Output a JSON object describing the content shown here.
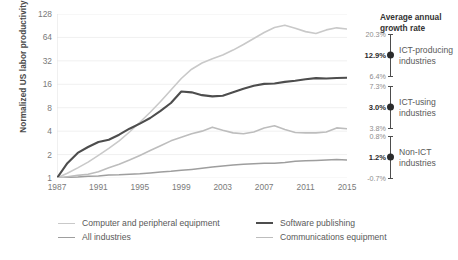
{
  "chart_data": {
    "type": "line",
    "title": "",
    "xlabel": "",
    "ylabel": "Normalized US labor productivity",
    "yscale": "log2",
    "ylim": [
      1,
      128
    ],
    "ytick_labels": [
      "1",
      "2",
      "4",
      "8",
      "16",
      "32",
      "64",
      "128"
    ],
    "ytick_values": [
      1,
      2,
      4,
      8,
      16,
      32,
      64,
      128
    ],
    "xlim": [
      1987,
      2015
    ],
    "xtick_labels": [
      "1987",
      "1991",
      "1995",
      "1999",
      "2003",
      "2007",
      "2011",
      "2015"
    ],
    "xtick_values": [
      1987,
      1991,
      1995,
      1999,
      2003,
      2007,
      2011,
      2015
    ],
    "grid": false,
    "legend_position": "bottom",
    "x": [
      1987,
      1988,
      1989,
      1990,
      1991,
      1992,
      1993,
      1994,
      1995,
      1996,
      1997,
      1998,
      1999,
      2000,
      2001,
      2002,
      2003,
      2004,
      2005,
      2006,
      2007,
      2008,
      2009,
      2010,
      2011,
      2012,
      2013,
      2014,
      2015
    ],
    "series": [
      {
        "name": "Computer and peripheral equipment",
        "color": "#c9c9c9",
        "width": 1.6,
        "values": [
          1.0,
          1.15,
          1.35,
          1.6,
          1.95,
          2.4,
          3.0,
          3.9,
          5.2,
          7.0,
          9.6,
          13.5,
          19.0,
          25.0,
          30.0,
          34.0,
          38.0,
          44.0,
          52.0,
          62.0,
          74.0,
          86.0,
          92.0,
          84.0,
          76.0,
          72.0,
          80.0,
          85.0,
          82.0
        ]
      },
      {
        "name": "All industries",
        "color": "#9e9e9e",
        "width": 1.5,
        "values": [
          1.0,
          1.02,
          1.03,
          1.05,
          1.06,
          1.09,
          1.1,
          1.12,
          1.13,
          1.16,
          1.19,
          1.22,
          1.26,
          1.29,
          1.33,
          1.38,
          1.43,
          1.47,
          1.5,
          1.53,
          1.55,
          1.55,
          1.58,
          1.64,
          1.66,
          1.68,
          1.7,
          1.73,
          1.7
        ]
      },
      {
        "name": "Software publishing",
        "color": "#4d4d4d",
        "width": 2.1,
        "values": [
          1.0,
          1.55,
          2.1,
          2.5,
          2.9,
          3.1,
          3.6,
          4.3,
          5.0,
          5.9,
          7.3,
          9.2,
          12.9,
          12.6,
          11.6,
          11.2,
          11.4,
          12.6,
          14.0,
          15.3,
          16.2,
          16.4,
          17.2,
          17.8,
          18.6,
          19.2,
          19.0,
          19.3,
          19.4
        ]
      },
      {
        "name": "Communications equipment",
        "color": "#bdbdbd",
        "width": 1.6,
        "values": [
          1.0,
          1.04,
          1.08,
          1.12,
          1.2,
          1.35,
          1.5,
          1.7,
          1.95,
          2.25,
          2.6,
          3.0,
          3.35,
          3.7,
          4.0,
          4.5,
          4.1,
          3.8,
          3.7,
          3.9,
          4.4,
          4.7,
          4.2,
          3.85,
          3.8,
          3.8,
          3.9,
          4.4,
          4.3
        ]
      }
    ]
  },
  "right_panel": {
    "title": "Average annual\ngrowth rate",
    "title_line1": "Average annual",
    "title_line2": "growth rate",
    "groups": [
      {
        "label": "ICT-producing\nindustries",
        "label_line1": "ICT-producing",
        "label_line2": "industries",
        "top": "20.3%",
        "mid": "12.9%",
        "bottom": "6.4%",
        "top_value": 20.3,
        "mid_value": 12.9,
        "bottom_value": 6.4
      },
      {
        "label": "ICT-using\nindustries",
        "label_line1": "ICT-using",
        "label_line2": "industries",
        "top": "7.3%",
        "mid": "3.0%",
        "bottom": "3.8%",
        "top_value": 7.3,
        "mid_value": 3.0,
        "bottom_value": 3.8
      },
      {
        "label": "Non-ICT\nindustries",
        "label_line1": "Non-ICT",
        "label_line2": "industries",
        "top": "0.8%",
        "mid": "1.2%",
        "bottom": "-0.7%",
        "top_value": 0.8,
        "mid_value": 1.2,
        "bottom_value": -0.7
      }
    ]
  },
  "legend": {
    "items": [
      {
        "label": "Computer and peripheral equipment",
        "color": "#c9c9c9",
        "thickness": "1.6px"
      },
      {
        "label": "All industries",
        "color": "#9e9e9e",
        "thickness": "1.8px"
      },
      {
        "label": "Software publishing",
        "color": "#4d4d4d",
        "thickness": "2.2px"
      },
      {
        "label": "Communications equipment",
        "color": "#bdbdbd",
        "thickness": "1.6px"
      }
    ]
  }
}
